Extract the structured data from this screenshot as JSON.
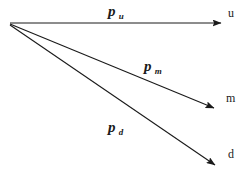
{
  "figure": {
    "kind": "vector-diagram",
    "background_color": "#ffffff",
    "stroke_color": "#1a1a1a",
    "origin": {
      "x": 10,
      "y": 23
    }
  },
  "vectors": [
    {
      "id": "up",
      "label_base": "p",
      "label_sub": "u",
      "label_x": 108,
      "label_y": 4,
      "tip_label": "u",
      "tip_label_x": 228,
      "tip_label_y": 7,
      "x1": 10,
      "y1": 23,
      "x2": 221,
      "y2": 23
    },
    {
      "id": "mid",
      "label_base": "p",
      "label_sub": "m",
      "label_x": 144,
      "label_y": 59,
      "tip_label": "m",
      "tip_label_x": 226,
      "tip_label_y": 92,
      "x1": 10,
      "y1": 24,
      "x2": 214,
      "y2": 108
    },
    {
      "id": "down",
      "label_base": "p",
      "label_sub": "d",
      "label_x": 108,
      "label_y": 120,
      "tip_label": "d",
      "tip_label_x": 228,
      "tip_label_y": 148,
      "x1": 10,
      "y1": 25,
      "x2": 215,
      "y2": 165
    }
  ]
}
